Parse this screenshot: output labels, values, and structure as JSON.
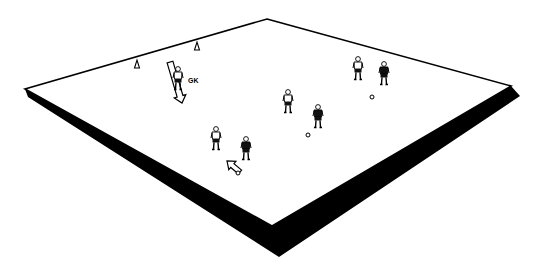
{
  "diagram": {
    "type": "soccer-drill",
    "colors": {
      "pitch": "#ffffff",
      "line": "#000000",
      "shadow": "#000000",
      "dark_shirt": "#111111"
    },
    "pitch": {
      "corners": {
        "top": [
          267,
          19
        ],
        "right": [
          511,
          86
        ],
        "bottom": [
          272,
          226
        ],
        "left": [
          25,
          89
        ]
      },
      "shadow": {
        "left_start": [
          28,
          97
        ],
        "bottom": [
          279,
          257
        ],
        "right_end": [
          520,
          96
        ]
      }
    },
    "cones": [
      {
        "id": "cone-1",
        "x": 137,
        "y": 64
      },
      {
        "id": "cone-2",
        "x": 197,
        "y": 46
      }
    ],
    "goalkeeper": {
      "label": "GK",
      "x": 178,
      "y": 80,
      "label_x": 188,
      "label_y": 83
    },
    "arrows": [
      {
        "id": "gk-run-arrow",
        "from": [
          170,
          62
        ],
        "to": [
          182,
          103
        ],
        "width": 6
      },
      {
        "id": "pass-arrow",
        "from": [
          240,
          172
        ],
        "to": [
          227,
          161
        ],
        "width": 5
      }
    ],
    "players": [
      {
        "id": "attacker-1",
        "team": "white",
        "x": 216,
        "y": 140
      },
      {
        "id": "defender-1",
        "team": "dark",
        "x": 246,
        "y": 150
      },
      {
        "id": "attacker-2",
        "team": "white",
        "x": 288,
        "y": 103
      },
      {
        "id": "defender-2",
        "team": "dark",
        "x": 318,
        "y": 118
      },
      {
        "id": "attacker-3",
        "team": "white",
        "x": 358,
        "y": 70
      },
      {
        "id": "defender-3",
        "team": "dark",
        "x": 384,
        "y": 75
      }
    ],
    "balls": [
      {
        "id": "ball-1",
        "x": 238,
        "y": 173
      },
      {
        "id": "ball-2",
        "x": 308,
        "y": 135
      },
      {
        "id": "ball-3",
        "x": 372,
        "y": 97
      }
    ]
  }
}
